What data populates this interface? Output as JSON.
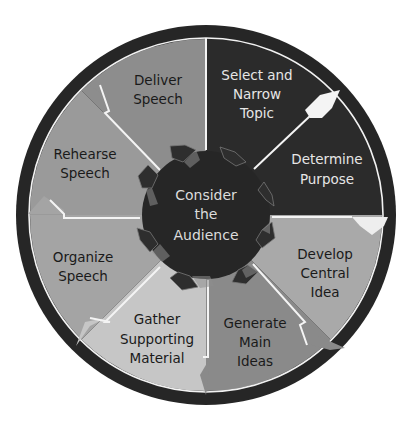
{
  "diagram": {
    "center": {
      "lines": [
        "Consider",
        "the",
        "Audience"
      ]
    },
    "steps": [
      {
        "id": "select-topic",
        "lines": [
          "Select and",
          "Narrow",
          "Topic"
        ],
        "color": "#2b2b2b",
        "text_color": "light"
      },
      {
        "id": "determine-purpose",
        "lines": [
          "Determine",
          "Purpose"
        ],
        "color": "#2b2b2b",
        "text_color": "light"
      },
      {
        "id": "develop-central-idea",
        "lines": [
          "Develop",
          "Central",
          "Idea"
        ],
        "color": "#a9a9a9",
        "text_color": "dark"
      },
      {
        "id": "generate-main-ideas",
        "lines": [
          "Generate",
          "Main",
          "Ideas"
        ],
        "color": "#8a8a8a",
        "text_color": "dark"
      },
      {
        "id": "gather-supporting-material",
        "lines": [
          "Gather",
          "Supporting",
          "Material"
        ],
        "color": "#c6c6c6",
        "text_color": "dark"
      },
      {
        "id": "organize-speech",
        "lines": [
          "Organize",
          "Speech"
        ],
        "color": "#a4a4a4",
        "text_color": "dark"
      },
      {
        "id": "rehearse-speech",
        "lines": [
          "Rehearse",
          "Speech"
        ],
        "color": "#9a9a9a",
        "text_color": "dark"
      },
      {
        "id": "deliver-speech",
        "lines": [
          "Deliver",
          "Speech"
        ],
        "color": "#8d8d8d",
        "text_color": "dark"
      }
    ],
    "colors": {
      "outer_ring": "#262626",
      "ring_line": "#f2f2f2",
      "center_hub": "#262626",
      "divider": "#f4f4f4"
    }
  }
}
